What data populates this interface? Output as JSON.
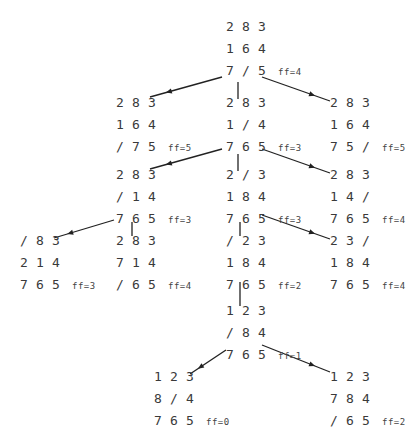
{
  "diagram": {
    "title": "",
    "blank_symbol": "/",
    "nodes": [
      {
        "id": "n0",
        "rows": [
          [
            "2",
            "8",
            "3"
          ],
          [
            "1",
            "6",
            "4"
          ],
          [
            "7",
            "/",
            "5"
          ]
        ],
        "label": "ff=4"
      },
      {
        "id": "n1",
        "rows": [
          [
            "2",
            "8",
            "3"
          ],
          [
            "1",
            "6",
            "4"
          ],
          [
            "/",
            "7",
            "5"
          ]
        ],
        "label": "ff=5"
      },
      {
        "id": "n2",
        "rows": [
          [
            "2",
            "8",
            "3"
          ],
          [
            "1",
            "/",
            "4"
          ],
          [
            "7",
            "6",
            "5"
          ]
        ],
        "label": "ff=3"
      },
      {
        "id": "n3",
        "rows": [
          [
            "2",
            "8",
            "3"
          ],
          [
            "1",
            "6",
            "4"
          ],
          [
            "7",
            "5",
            "/"
          ]
        ],
        "label": "ff=5"
      },
      {
        "id": "n4",
        "rows": [
          [
            "2",
            "8",
            "3"
          ],
          [
            "/",
            "1",
            "4"
          ],
          [
            "7",
            "6",
            "5"
          ]
        ],
        "label": "ff=3"
      },
      {
        "id": "n5",
        "rows": [
          [
            "2",
            "/",
            "3"
          ],
          [
            "1",
            "8",
            "4"
          ],
          [
            "7",
            "6",
            "5"
          ]
        ],
        "label": "ff=3"
      },
      {
        "id": "n6",
        "rows": [
          [
            "2",
            "8",
            "3"
          ],
          [
            "1",
            "4",
            "/"
          ],
          [
            "7",
            "6",
            "5"
          ]
        ],
        "label": "ff=4"
      },
      {
        "id": "n7",
        "rows": [
          [
            "/",
            "8",
            "3"
          ],
          [
            "2",
            "1",
            "4"
          ],
          [
            "7",
            "6",
            "5"
          ]
        ],
        "label": "ff=3"
      },
      {
        "id": "n8",
        "rows": [
          [
            "2",
            "8",
            "3"
          ],
          [
            "7",
            "1",
            "4"
          ],
          [
            "/",
            "6",
            "5"
          ]
        ],
        "label": "ff=4"
      },
      {
        "id": "n9",
        "rows": [
          [
            "/",
            "2",
            "3"
          ],
          [
            "1",
            "8",
            "4"
          ],
          [
            "7",
            "6",
            "5"
          ]
        ],
        "label": "ff=2"
      },
      {
        "id": "n10",
        "rows": [
          [
            "2",
            "3",
            "/"
          ],
          [
            "1",
            "8",
            "4"
          ],
          [
            "7",
            "6",
            "5"
          ]
        ],
        "label": "ff=4"
      },
      {
        "id": "n11",
        "rows": [
          [
            "1",
            "2",
            "3"
          ],
          [
            "/",
            "8",
            "4"
          ],
          [
            "7",
            "6",
            "5"
          ]
        ],
        "label": "ff=1"
      },
      {
        "id": "n12",
        "rows": [
          [
            "1",
            "2",
            "3"
          ],
          [
            "8",
            "/",
            "4"
          ],
          [
            "7",
            "6",
            "5"
          ]
        ],
        "label": "ff=0"
      },
      {
        "id": "n13",
        "rows": [
          [
            "1",
            "2",
            "3"
          ],
          [
            "7",
            "8",
            "4"
          ],
          [
            "/",
            "6",
            "5"
          ]
        ],
        "label": "ff=2"
      }
    ],
    "edges": [
      {
        "from": "n0",
        "to": "n1",
        "style": "arrow"
      },
      {
        "from": "n0",
        "to": "n2",
        "style": "line"
      },
      {
        "from": "n0",
        "to": "n3",
        "style": "arrow"
      },
      {
        "from": "n2",
        "to": "n4",
        "style": "arrow"
      },
      {
        "from": "n2",
        "to": "n5",
        "style": "line"
      },
      {
        "from": "n2",
        "to": "n6",
        "style": "arrow"
      },
      {
        "from": "n4",
        "to": "n7",
        "style": "arrow"
      },
      {
        "from": "n4",
        "to": "n8",
        "style": "line"
      },
      {
        "from": "n5",
        "to": "n9",
        "style": "line"
      },
      {
        "from": "n5",
        "to": "n10",
        "style": "arrow"
      },
      {
        "from": "n9",
        "to": "n11",
        "style": "line"
      },
      {
        "from": "n11",
        "to": "n12",
        "style": "arrow"
      },
      {
        "from": "n11",
        "to": "n13",
        "style": "arrow"
      }
    ]
  }
}
